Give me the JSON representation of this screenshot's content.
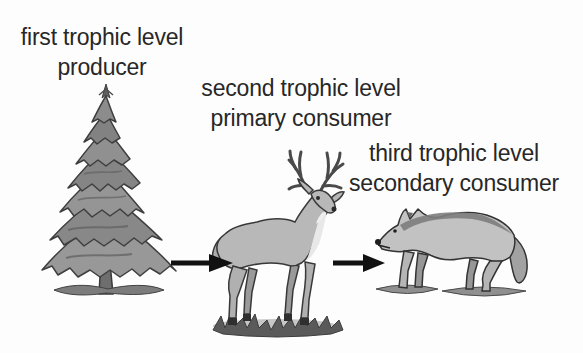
{
  "page": {
    "background": "#fdfdfd",
    "text_color": "#272727",
    "arrow_color": "#111111"
  },
  "levels": [
    {
      "name": "first trophic level",
      "role": "producer",
      "organism_icon": "conifer-tree-illustration"
    },
    {
      "name": "second trophic level",
      "role": "primary consumer",
      "organism_icon": "deer-illustration"
    },
    {
      "name": "third trophic level",
      "role": "secondary consumer",
      "organism_icon": "wolf-illustration"
    }
  ],
  "arrows": [
    {
      "icon": "arrow-right-icon",
      "from": "producer",
      "to": "primary consumer"
    },
    {
      "icon": "arrow-right-icon",
      "from": "primary consumer",
      "to": "secondary consumer"
    }
  ]
}
